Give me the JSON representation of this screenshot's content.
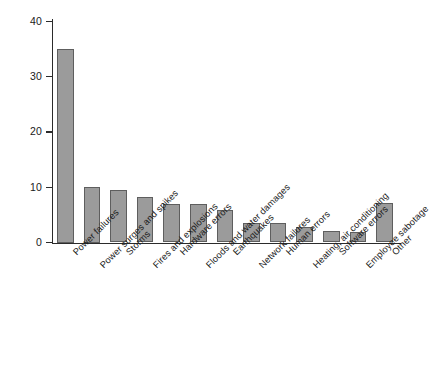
{
  "chart_data": {
    "type": "bar",
    "title": "",
    "subtitle": "",
    "xlabel": "",
    "ylabel": "",
    "ylim": [
      0,
      40
    ],
    "yticks": [
      0,
      10,
      20,
      30,
      40
    ],
    "grid": false,
    "legend": null,
    "orientation": "vertical",
    "bar_color": "#9b9b9b",
    "bar_edge_color": "#5e5e5e",
    "axis_color": "#2b2b2b",
    "categories": [
      "Power failures",
      "Power surges and spikes",
      "Storms",
      "Fires and explosions",
      "Hardware errors",
      "Floods and water damages",
      "Earthquakes",
      "Network failures",
      "Human errors",
      "Heating, air conditioning",
      "Software errors",
      "Employee sabotage",
      "Other"
    ],
    "values": [
      35,
      10,
      9.5,
      8.3,
      7,
      7,
      5.8,
      3.6,
      3.6,
      2.8,
      2,
      1.9,
      7.2
    ]
  },
  "axis": {
    "y_tick_labels": [
      "40",
      "30",
      "20",
      "10",
      "0"
    ]
  }
}
